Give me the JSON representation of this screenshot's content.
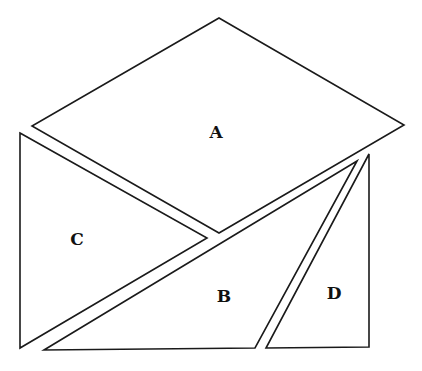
{
  "diagram": {
    "title": "",
    "shapes": [
      {
        "id": "A",
        "label": "A",
        "type": "parallelogram",
        "points": [
          [
            219,
            18
          ],
          [
            404,
            125
          ],
          [
            219,
            233
          ],
          [
            32,
            126
          ]
        ],
        "label_pos": [
          216,
          133
        ]
      },
      {
        "id": "B",
        "label": "B",
        "type": "triangle",
        "points": [
          [
            357,
            161
          ],
          [
            255,
            348
          ],
          [
            44,
            350
          ]
        ],
        "label_pos": [
          224,
          297
        ]
      },
      {
        "id": "C",
        "label": "C",
        "type": "triangle",
        "points": [
          [
            20,
            133
          ],
          [
            207,
            238
          ],
          [
            20,
            348
          ]
        ],
        "label_pos": [
          77,
          240
        ]
      },
      {
        "id": "D",
        "label": "D",
        "type": "triangle",
        "points": [
          [
            369,
            154
          ],
          [
            369,
            347
          ],
          [
            266,
            348
          ]
        ],
        "label_pos": [
          334,
          294
        ]
      }
    ],
    "colors": {
      "stroke": "#1a1a1a",
      "fill": "#ffffff",
      "background": "#ffffff",
      "text": "#111111"
    }
  }
}
